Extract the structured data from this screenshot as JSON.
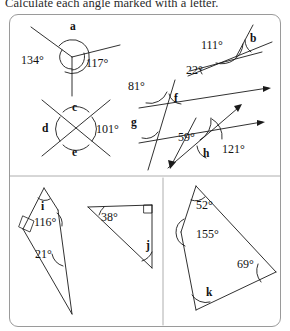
{
  "instruction": "Calculate each angle marked with a letter.",
  "panel": {
    "border_color": "#9a9a9a",
    "background": "#ffffff"
  },
  "figures": [
    {
      "id": "figure-a",
      "name": "three-rays-around-point",
      "unknown": "a",
      "known_angles": [
        "134°",
        "117°"
      ],
      "labels": {
        "letter": "a",
        "left": "134°",
        "right": "117°"
      }
    },
    {
      "id": "figure-b",
      "name": "angles-on-a-line-transversal",
      "unknown": "b",
      "known_angles": [
        "111°",
        "22°"
      ],
      "labels": {
        "letter": "b",
        "upper": "111°",
        "lower": "22°"
      }
    },
    {
      "id": "figure-cde",
      "name": "vertically-opposite-angles",
      "unknown": "c, d, e",
      "known_angles": [
        "101°"
      ],
      "labels": {
        "top": "c",
        "left": "d",
        "bottom": "e",
        "right": "101°"
      }
    },
    {
      "id": "figure-fgh",
      "name": "parallel-lines-with-transversals",
      "unknown": "f, g, h",
      "known_angles": [
        "81°",
        "59°",
        "121°"
      ],
      "labels": {
        "upper_left": "81°",
        "f": "f",
        "g": "g",
        "middle": "59°",
        "h": "h",
        "right": "121°"
      }
    },
    {
      "id": "figure-i",
      "name": "quadrilateral-with-right-angle",
      "unknown": "i",
      "known_angles": [
        "116°",
        "21°"
      ],
      "labels": {
        "letter": "i",
        "mid": "116°",
        "low": "21°"
      }
    },
    {
      "id": "figure-j",
      "name": "right-triangle",
      "unknown": "j",
      "known_angles": [
        "38°",
        "90°"
      ],
      "labels": {
        "letter": "j",
        "apex": "38°"
      }
    },
    {
      "id": "figure-k",
      "name": "quadrilateral-angle-sum",
      "unknown": "k",
      "known_angles": [
        "52°",
        "155°",
        "69°"
      ],
      "labels": {
        "letter": "k",
        "top": "52°",
        "left": "155°",
        "right": "69°"
      }
    }
  ]
}
